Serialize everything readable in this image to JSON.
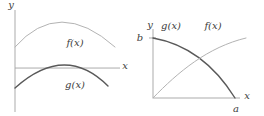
{
  "figure": {
    "colors": {
      "background": "#ffffff",
      "axis": "#ababab",
      "f_curve": "#b3b3b3",
      "g_curve": "#595959",
      "text": "#3d3d3d"
    }
  },
  "labels": {
    "left": {
      "y_axis": "y",
      "x_axis": "x",
      "f": "f(x)",
      "g": "g(x)"
    },
    "right": {
      "y_axis": "y",
      "x_axis": "x",
      "f": "f(x)",
      "g": "g(x)",
      "a_tick": "a",
      "b_tick": "b"
    }
  },
  "chart_data": [
    {
      "type": "line",
      "title": "",
      "xlabel": "x",
      "ylabel": "y",
      "grid": false,
      "axes": {
        "x_axis_v": 0.431,
        "x_range_norm": [
          0,
          1
        ],
        "y_range_norm": [
          0,
          1
        ]
      },
      "tick_labels": {
        "x": [],
        "y": []
      },
      "series": [
        {
          "key": "f",
          "name": "f(x)",
          "color_role": "light",
          "curve": "quadratic-bezier",
          "points_norm": [
            [
              0,
              0.637
            ],
            [
              0.419,
              1.127
            ],
            [
              0.952,
              0.637
            ]
          ],
          "shape": "concave-down arc entirely above the x-axis, peak near middle"
        },
        {
          "key": "g",
          "name": "g(x)",
          "color_role": "dark",
          "curve": "quadratic-bezier",
          "points_norm": [
            [
              0,
              0.235
            ],
            [
              0.476,
              0.676
            ],
            [
              0.886,
              0.255
            ]
          ],
          "shape": "concave-down arc straddling the x-axis, peak slightly above axis"
        }
      ]
    },
    {
      "type": "line",
      "title": "",
      "xlabel": "x",
      "ylabel": "y",
      "grid": false,
      "axes": {
        "x_axis_v": 0,
        "x_range_norm": [
          0,
          1
        ],
        "y_range_norm": [
          0,
          1
        ]
      },
      "tick_labels": {
        "x": [
          "a"
        ],
        "y": [
          "b"
        ]
      },
      "ticks_norm": {
        "a_u": 0.943,
        "b_v": 0.87
      },
      "series": [
        {
          "key": "g",
          "name": "g(x)",
          "color_role": "dark",
          "curve": "cubic-bezier",
          "points_norm": [
            [
              0,
              0.87
            ],
            [
              0.391,
              0.783
            ],
            [
              0.713,
              0.464
            ],
            [
              0.943,
              0
            ]
          ],
          "shape": "decreasing concave-down curve from (0,b) to (a,0)"
        },
        {
          "key": "f",
          "name": "f(x)",
          "color_role": "light",
          "curve": "cubic-bezier",
          "points_norm": [
            [
              0,
              0
            ],
            [
              0.287,
              0.377
            ],
            [
              0.632,
              0.739
            ],
            [
              1.069,
              0.87
            ]
          ],
          "shape": "increasing concave-down curve from origin levelling off near b"
        }
      ]
    }
  ]
}
